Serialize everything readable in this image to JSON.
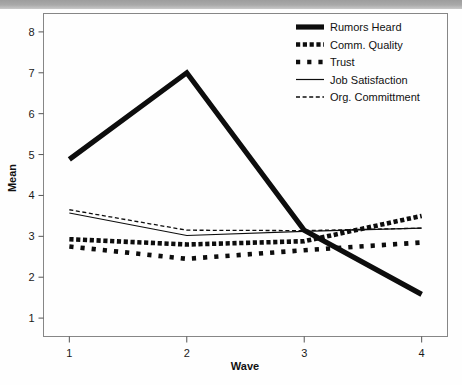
{
  "chart_data": {
    "type": "line",
    "title": "",
    "xlabel": "Wave",
    "ylabel": "Mean",
    "x": [
      1,
      2,
      3,
      4
    ],
    "xticklabels": [
      "1",
      "2",
      "3",
      "4"
    ],
    "yticklabels": [
      "1",
      "2",
      "3",
      "4",
      "5",
      "6",
      "7",
      "8"
    ],
    "yticks": [
      1,
      2,
      3,
      4,
      5,
      6,
      7,
      8
    ],
    "xlim": [
      0.78,
      4.22
    ],
    "ylim": [
      0.55,
      8.45
    ],
    "grid": false,
    "legend_position": "top-right",
    "series": [
      {
        "name": "Rumors Heard",
        "style": "thick-solid",
        "values": [
          4.88,
          7.0,
          3.15,
          1.58
        ]
      },
      {
        "name": "Comm. Quality",
        "style": "thick-dashed-dense",
        "values": [
          2.93,
          2.8,
          2.88,
          3.5
        ]
      },
      {
        "name": "Trust",
        "style": "thick-dashed-sparse",
        "values": [
          2.75,
          2.45,
          2.66,
          2.85
        ]
      },
      {
        "name": "Job Satisfaction",
        "style": "thin-solid",
        "values": [
          3.57,
          3.02,
          3.12,
          3.2
        ]
      },
      {
        "name": "Org. Committment",
        "style": "thin-dashed",
        "values": [
          3.65,
          3.15,
          3.14,
          3.2
        ]
      }
    ],
    "legend_entries": [
      {
        "label": "Rumors Heard",
        "style": "thick-solid"
      },
      {
        "label": "Comm. Quality",
        "style": "thick-dashed-dense"
      },
      {
        "label": "Trust",
        "style": "thick-dashed-sparse"
      },
      {
        "label": "Job Satisfaction",
        "style": "thin-solid"
      },
      {
        "label": "Org. Committment",
        "style": "thin-dashed"
      }
    ],
    "colors": {
      "series": "#0d0d0d",
      "frame": "#868686",
      "text": "#111111",
      "background": "#fefefe"
    }
  }
}
